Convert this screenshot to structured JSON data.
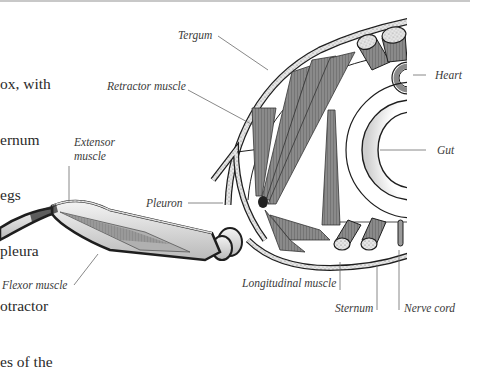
{
  "figure": {
    "body_text_lines": [
      "ox, with",
      "ernum",
      "egs",
      "pleura",
      "otractor",
      "es of the"
    ],
    "labels": {
      "tergum": "Tergum",
      "retractor_muscle": "Retractor muscle",
      "heart": "Heart",
      "gut": "Gut",
      "extensor_muscle_line1": "Extensor",
      "extensor_muscle_line2": "muscle",
      "pleuron": "Pleuron",
      "flexor_muscle": "Flexor muscle",
      "longitudinal_muscle": "Longitudinal muscle",
      "sternum": "Sternum",
      "nerve_cord": "Nerve cord"
    },
    "colors": {
      "outline": "#1e1e1e",
      "muscle": "#7a7a7a",
      "cuticle_fill": "#d8d8d8",
      "leader_line": "#6a6a6a",
      "text": "#3a3a3a"
    }
  }
}
